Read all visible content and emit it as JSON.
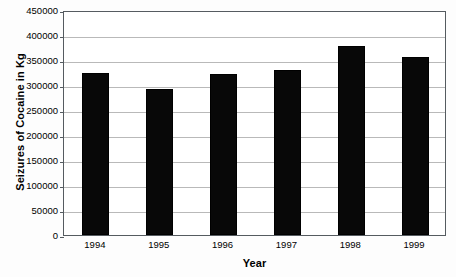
{
  "chart_data": {
    "type": "bar",
    "title": "",
    "xlabel": "Year",
    "ylabel": "Seizures of Cocaine in Kg",
    "categories": [
      "1994",
      "1995",
      "1996",
      "1997",
      "1998",
      "1999"
    ],
    "values": [
      324000,
      292000,
      322000,
      331000,
      379000,
      356000
    ],
    "series": [
      {
        "name": "Seizures of Cocaine in Kg",
        "values": [
          324000,
          292000,
          322000,
          331000,
          379000,
          356000
        ]
      }
    ],
    "ylim": [
      0,
      450000
    ],
    "ytick_labels": [
      "0",
      "50000",
      "100000",
      "150000",
      "200000",
      "250000",
      "300000",
      "350000",
      "400000",
      "450000"
    ],
    "ytick_values": [
      0,
      50000,
      100000,
      150000,
      200000,
      250000,
      300000,
      350000,
      400000,
      450000
    ],
    "grid": true,
    "grid_axis": "y",
    "legend": false,
    "legend_position": "none",
    "bar_color": "#080808",
    "grid_color": "#b9b9b9",
    "axis_color": "#555b60",
    "background_color": "#ffffff"
  }
}
